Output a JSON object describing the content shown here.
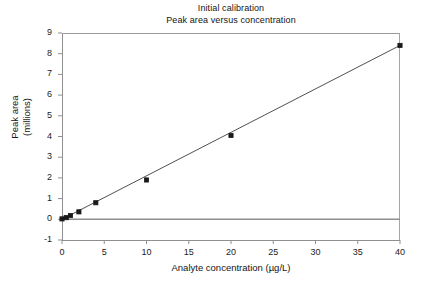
{
  "chart_data": {
    "type": "scatter",
    "title": "Initial calibration",
    "subtitle": "Peak area versus concentration",
    "xlabel": "Analyte concentration (µg/L)",
    "ylabel_line1": "Peak area",
    "ylabel_line2": "(millions)",
    "xlim": [
      0,
      40
    ],
    "ylim": [
      -1,
      9
    ],
    "xticks": [
      0,
      5,
      10,
      15,
      20,
      25,
      30,
      35,
      40
    ],
    "xtick_labels": [
      "0",
      "5",
      "10",
      "15",
      "20",
      "25",
      "30",
      "35",
      "40"
    ],
    "yticks": [
      -1,
      0,
      1,
      2,
      3,
      4,
      5,
      6,
      7,
      8,
      9
    ],
    "ytick_labels": [
      "-1",
      "0",
      "1",
      "2",
      "3",
      "4",
      "5",
      "6",
      "7",
      "8",
      "9"
    ],
    "grid": false,
    "legend": null,
    "x": [
      0,
      0.5,
      1,
      2,
      4,
      10,
      20,
      40
    ],
    "y": [
      0.02,
      0.08,
      0.18,
      0.36,
      0.8,
      1.9,
      4.05,
      8.4
    ],
    "series": [
      {
        "name": "Calibration standards",
        "marker": "square",
        "marker_color": "#1a1a1a",
        "values": [
          0.02,
          0.08,
          0.18,
          0.36,
          0.8,
          1.9,
          4.05,
          8.4
        ]
      }
    ],
    "fit_line": {
      "name": "Calibration fit",
      "color": "#3c3c3c",
      "x_start": 0,
      "y_start": 0.0,
      "x_end": 40,
      "y_end": 8.4
    },
    "baseline": {
      "name": "Zero baseline",
      "color": "#8f8f8f",
      "y": 0
    },
    "colors": {
      "axis": "#8f8f8f",
      "text": "#141414",
      "marker": "#1a1a1a",
      "fit_line": "#3c3c3c",
      "background": "#ffffff"
    }
  }
}
